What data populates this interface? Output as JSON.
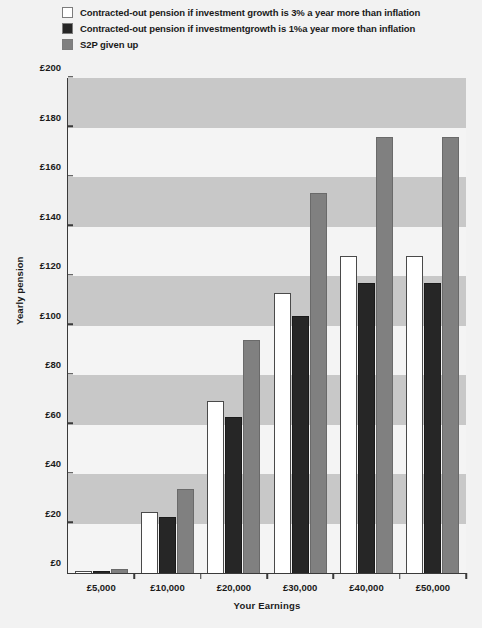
{
  "legend": {
    "position": "top-left",
    "items": [
      {
        "label": "Contracted-out pension if investment growth is 3% a year more than inflation",
        "color": "#ffffff",
        "swatch_name": "legend-swatch-white"
      },
      {
        "label": "Contracted-out pension if investmentgrowth is 1%a year more than inflation",
        "color": "#262626",
        "swatch_name": "legend-swatch-black"
      },
      {
        "label": "S2P given up",
        "color": "#808080",
        "swatch_name": "legend-swatch-grey"
      }
    ]
  },
  "chart_data": {
    "type": "bar",
    "title": "",
    "subtitle": "",
    "xlabel": "Your Earnings",
    "ylabel": "Yearly pension",
    "categories": [
      "£5,000",
      "£10,000",
      "£20,000",
      "£30,000",
      "£40,000",
      "£50,000"
    ],
    "series": [
      {
        "name": "Contracted-out pension if investment growth is 3% a year more than inflation",
        "color": "#ffffff",
        "values": [
          1,
          24.5,
          69.5,
          113,
          128,
          128
        ]
      },
      {
        "name": "Contracted-out pension if investmentgrowth is 1%a year more than inflation",
        "color": "#262626",
        "values": [
          1,
          22.5,
          63,
          104,
          117,
          117
        ]
      },
      {
        "name": "S2P given up",
        "color": "#808080",
        "values": [
          1.5,
          34,
          94,
          153.5,
          176,
          176
        ]
      }
    ],
    "ylim": [
      0,
      200
    ],
    "ytick_values": [
      0,
      20,
      40,
      60,
      80,
      100,
      120,
      140,
      160,
      180,
      200
    ],
    "ytick_labels": [
      "£0",
      "£20",
      "£40",
      "£60",
      "£80",
      "£100",
      "£120",
      "£140",
      "£160",
      "£180",
      "£200"
    ],
    "grid": false,
    "banding": true,
    "band_colors": {
      "dark": "#c8c8c8",
      "light": "#f4f4f4"
    },
    "legend_position": "top-left",
    "background": "#f2f2f2"
  }
}
